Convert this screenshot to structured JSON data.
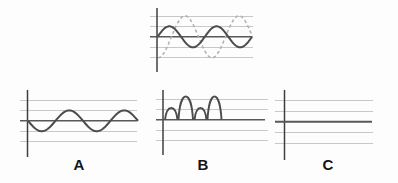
{
  "figure": {
    "width": 398,
    "height": 183,
    "background": "#fdfdfd",
    "colors": {
      "axis": "#3f3f3f",
      "grid": "#c8c8c8",
      "midline": "#585858",
      "solid_wave": "#4c4c4c",
      "dashed_wave": "#b2b2b2",
      "label": "#141414"
    },
    "panels": {
      "top": {
        "axis": {
          "x": 157,
          "y0": 8,
          "y1": 72
        },
        "grid_ys": [
          16,
          26.5,
          47,
          57.5
        ],
        "grid_x0": 150,
        "grid_x1": 253,
        "mid_y": 36.8,
        "mid_x0": 150,
        "mid_x1": 252.5,
        "mid_w": 1.4,
        "dashed": {
          "x0": 158,
          "x1": 252.5,
          "amp": 21,
          "cycles": 1.75,
          "form": "cos",
          "dir": 1
        },
        "solid": {
          "x0": 157.5,
          "x1": 252,
          "amp": 10.5,
          "cycles": 2,
          "form": "sin",
          "dir": -1
        }
      },
      "a": {
        "label": "A",
        "label_x": 79,
        "label_y": 169.5,
        "axis": {
          "x": 27.5,
          "y0": 90,
          "y1": 157
        },
        "grid_ys": [
          100,
          110.4,
          131.2,
          141.6
        ],
        "grid_x0": 20,
        "grid_x1": 137,
        "mid_y": 120.8,
        "mid_x0": 20,
        "mid_x1": 137,
        "mid_w": 1.5,
        "wave": {
          "x0": 28,
          "x1": 138,
          "amp": 10.4,
          "cycles": 2,
          "form": "sin",
          "dir": 1
        }
      },
      "b": {
        "label": "B",
        "label_x": 203,
        "label_y": 169.5,
        "axis": {
          "x": 163,
          "y0": 90,
          "y1": 155
        },
        "grid_ys": [
          99,
          109.3,
          130.2,
          140.5
        ],
        "grid_x0": 156,
        "grid_x1": 268,
        "mid_y": 119.8,
        "mid_x0": 156,
        "mid_x1": 265,
        "mid_w": 1.5,
        "humps": [
          [
            165,
            177.5,
            11.8
          ],
          [
            178.5,
            193,
            23.2
          ],
          [
            194.5,
            206.5,
            11.8
          ],
          [
            207.5,
            221.5,
            23.2
          ]
        ]
      },
      "c": {
        "label": "C",
        "label_x": 328,
        "label_y": 169.5,
        "axis": {
          "x": 284.5,
          "y0": 90,
          "y1": 160
        },
        "grid_ys": [
          100.5,
          111,
          132.6,
          143.3
        ],
        "grid_x0": 275,
        "grid_x1": 373,
        "mid_y": 121.8,
        "mid_x0": 275,
        "mid_x1": 372,
        "mid_w": 2.1
      }
    }
  },
  "chart_data": [
    {
      "id": "top-combined",
      "type": "line",
      "title": "",
      "series": [
        {
          "name": "solid-wave",
          "style": "solid",
          "amplitude_units": 1,
          "cycles_shown": 2,
          "start": "zero-rising"
        },
        {
          "name": "dashed-wave",
          "style": "dashed",
          "amplitude_units": 2,
          "cycles_shown": 1.75,
          "start": "minimum"
        }
      ],
      "ylim": [
        -2,
        2
      ],
      "grid": "horizontal gridlines at -2,-1,+1,+2"
    },
    {
      "id": "option-A",
      "type": "line",
      "label": "A",
      "series": [
        {
          "name": "sine-wave",
          "style": "solid",
          "amplitude_units": 1,
          "cycles_shown": 2,
          "start": "zero-falling"
        }
      ],
      "ylim": [
        -2,
        2
      ],
      "grid": "horizontal gridlines at -2,-1,+1,+2"
    },
    {
      "id": "option-B",
      "type": "line",
      "label": "B",
      "series": [
        {
          "name": "rectified-humps",
          "style": "solid",
          "description": "four half-wave arches above the axis with heights alternating 1,2,1,2 units, followed by flat line at zero"
        }
      ],
      "ylim": [
        -2,
        2
      ],
      "grid": "horizontal gridlines at -2,-1,+1,+2"
    },
    {
      "id": "option-C",
      "type": "line",
      "label": "C",
      "series": [
        {
          "name": "flat-line",
          "style": "solid",
          "description": "constant line at zero"
        }
      ],
      "ylim": [
        -2,
        2
      ],
      "grid": "horizontal gridlines at -2,-1,+1,+2"
    }
  ]
}
